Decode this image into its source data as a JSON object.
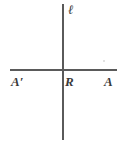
{
  "figure": {
    "kind": "geometry-diagram",
    "background_color": "#ffffff",
    "stroke_color": "#5a5a5a",
    "text_color": "#3a3a3a",
    "labels": {
      "vertical_line": "ℓ",
      "left_point": "A′",
      "intersection_point": "R",
      "right_point": "A"
    }
  }
}
